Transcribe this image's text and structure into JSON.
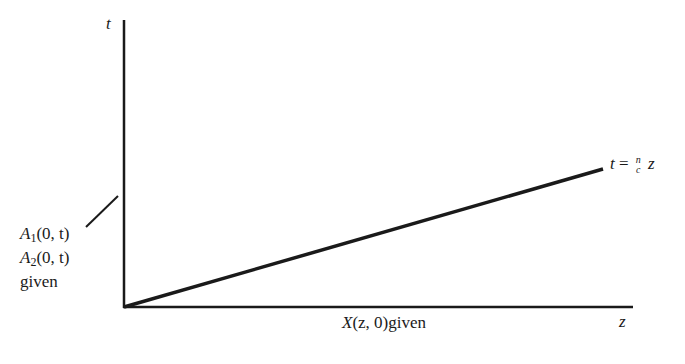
{
  "diagram": {
    "axes": {
      "vertical_label": "t",
      "horizontal_label": "z"
    },
    "line_label": {
      "lhs": "t",
      "eq": "=",
      "frac_num": "n",
      "frac_den": "c",
      "rhs": "z"
    },
    "boundary_label": {
      "line1_var": "A",
      "line1_sub": "1",
      "line1_args": "(0, t)",
      "line2_var": "A",
      "line2_sub": "2",
      "line2_args": "(0, t)",
      "line3": "given"
    },
    "initial_label": {
      "var": "X",
      "args": "(z, 0)",
      "suffix": "given"
    },
    "colors": {
      "ink": "#1a1a1a",
      "background": "#ffffff"
    }
  }
}
